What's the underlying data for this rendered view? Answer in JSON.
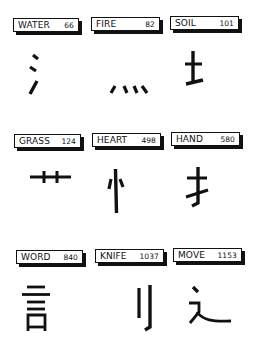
{
  "radicals": [
    {
      "name": "WATER",
      "number": "66",
      "glyph": "water-radical-icon"
    },
    {
      "name": "FIRE",
      "number": "82",
      "glyph": "fire-radical-icon"
    },
    {
      "name": "SOIL",
      "number": "101",
      "glyph": "soil-radical-icon"
    },
    {
      "name": "GRASS",
      "number": "124",
      "glyph": "grass-radical-icon"
    },
    {
      "name": "HEART",
      "number": "498",
      "glyph": "heart-radical-icon"
    },
    {
      "name": "HAND",
      "number": "580",
      "glyph": "hand-radical-icon"
    },
    {
      "name": "WORD",
      "number": "840",
      "glyph": "word-radical-icon"
    },
    {
      "name": "KNIFE",
      "number": "1037",
      "glyph": "knife-radical-icon"
    },
    {
      "name": "MOVE",
      "number": "1153",
      "glyph": "move-radical-icon"
    }
  ],
  "colors": {
    "ink": "#111111",
    "background": "#ffffff"
  }
}
